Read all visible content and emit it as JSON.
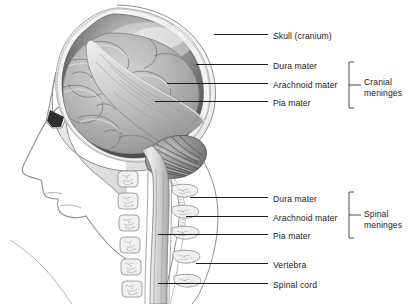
{
  "figure": {
    "background_color": "#ffffff",
    "line_color": "#1b1b1b",
    "text_color": "#1b1b1b"
  },
  "labels": [
    {
      "id": "skull",
      "text": "Skull (cranium)",
      "text_x": 273,
      "text_y": 31,
      "leader_x1": 214,
      "leader_x2": 268,
      "leader_y": 34
    },
    {
      "id": "cranial-dura",
      "text": "Dura mater",
      "text_x": 273,
      "text_y": 61,
      "leader_x1": 196,
      "leader_x2": 268,
      "leader_y": 64
    },
    {
      "id": "cranial-arachnoid",
      "text": "Arachnoid mater",
      "text_x": 273,
      "text_y": 80,
      "leader_x1": 167,
      "leader_x2": 268,
      "leader_y": 83
    },
    {
      "id": "cranial-pia",
      "text": "Pia mater",
      "text_x": 273,
      "text_y": 98,
      "leader_x1": 155,
      "leader_x2": 268,
      "leader_y": 101
    },
    {
      "id": "spinal-dura",
      "text": "Dura mater",
      "text_x": 273,
      "text_y": 194,
      "leader_x1": 190,
      "leader_x2": 268,
      "leader_y": 197
    },
    {
      "id": "spinal-arachnoid",
      "text": "Arachnoid mater",
      "text_x": 273,
      "text_y": 213,
      "leader_x1": 186,
      "leader_x2": 268,
      "leader_y": 216
    },
    {
      "id": "spinal-pia",
      "text": "Pia mater",
      "text_x": 273,
      "text_y": 231,
      "leader_x1": 158,
      "leader_x2": 268,
      "leader_y": 234
    },
    {
      "id": "vertebra",
      "text": "Vertebra",
      "text_x": 273,
      "text_y": 260,
      "leader_x1": 196,
      "leader_x2": 268,
      "leader_y": 263
    },
    {
      "id": "spinal-cord",
      "text": "Spinal cord",
      "text_x": 273,
      "text_y": 280,
      "leader_x1": 158,
      "leader_x2": 268,
      "leader_y": 283
    }
  ],
  "groups": [
    {
      "id": "cranial-meninges",
      "text": "Cranial\nmeninges",
      "text_x": 364,
      "text_y": 77,
      "bracket_x": 349,
      "bracket_top": 62,
      "bracket_bottom": 108,
      "stem_y": 85,
      "stem_x2": 361,
      "members": [
        "Dura mater",
        "Arachnoid mater",
        "Pia mater"
      ]
    },
    {
      "id": "spinal-meninges",
      "text": "Spinal\nmeninges",
      "text_x": 364,
      "text_y": 209,
      "bracket_x": 349,
      "bracket_top": 192,
      "bracket_bottom": 238,
      "stem_y": 215,
      "stem_x2": 361,
      "members": [
        "Dura mater",
        "Arachnoid mater",
        "Pia mater"
      ]
    }
  ],
  "anatomy": {
    "orientation": "left-facing profile, midsagittal section",
    "parts": [
      {
        "name": "skull-bone",
        "description": "outer cranial vault with stippled diploe texture"
      },
      {
        "name": "dura-mater-layer",
        "description": "dark grey lining inside the cranial vault"
      },
      {
        "name": "falx-cerebri",
        "description": "pale dural fold sweeping from frontal to occipital region"
      },
      {
        "name": "cerebrum",
        "description": "gyri and sulci of the cerebral hemisphere"
      },
      {
        "name": "cerebellum",
        "description": "striated arbor vitae below the occipital lobe"
      },
      {
        "name": "brainstem",
        "description": "continues inferiorly into the spinal cord"
      },
      {
        "name": "face-profile",
        "description": "outline of forehead, nose, lips and chin"
      },
      {
        "name": "vertebral-column",
        "description": "stack of cervical vertebral bodies and spinous processes"
      },
      {
        "name": "spinal-cord",
        "description": "cord running within the vertebral canal"
      },
      {
        "name": "neck-contour",
        "description": "curved posterior neck outline crossing the leader lines"
      }
    ]
  }
}
